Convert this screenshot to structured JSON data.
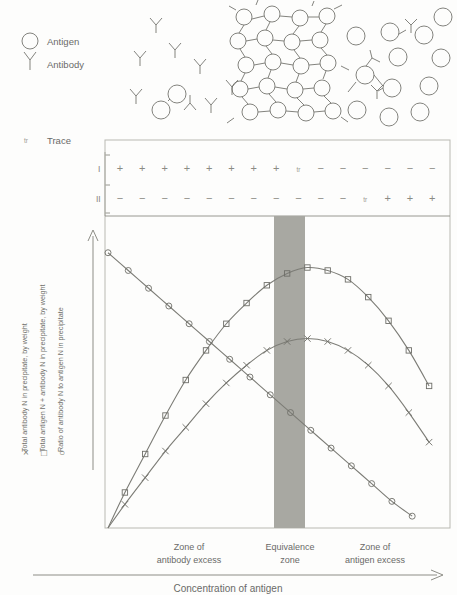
{
  "legend_top": [
    {
      "icon": "circle-icon",
      "label": "Antigen"
    },
    {
      "icon": "y-shape-icon",
      "label": "Antibody"
    }
  ],
  "trace_legend": {
    "symbol": "tr",
    "label": "Trace"
  },
  "series_legend": [
    {
      "symbol": "×",
      "label": "Total antibody N in precipitate, by weight"
    },
    {
      "symbol": "□",
      "label": "Total antigen N + antibody N in precipitate, by weight"
    },
    {
      "symbol": "○",
      "label": "Ratio of antibody N to antigen N in precipitate"
    }
  ],
  "supernatant_rows": [
    {
      "id": "I",
      "signs": [
        "+",
        "+",
        "+",
        "+",
        "+",
        "+",
        "+",
        "+",
        "tr",
        "−",
        "−",
        "−",
        "−",
        "−",
        "−"
      ]
    },
    {
      "id": "II",
      "signs": [
        "−",
        "−",
        "−",
        "−",
        "−",
        "−",
        "−",
        "−",
        "−",
        "−",
        "−",
        "tr",
        "+",
        "+",
        "+"
      ]
    }
  ],
  "zones": [
    {
      "line1": "Zone of",
      "line2": "antibody excess"
    },
    {
      "line1": "Equivalence",
      "line2": "zone"
    },
    {
      "line1": "Zone of",
      "line2": "antigen excess"
    }
  ],
  "x_axis_title": "Concentration of antigen",
  "colors": {
    "band": "#a8a8a2",
    "curve": "#7c7c76",
    "text": "#6a6a68",
    "frame": "#b9b9b2"
  },
  "chart_data": {
    "type": "line",
    "title": "",
    "xlabel": "Concentration of antigen",
    "ylabel": "",
    "grid": false,
    "legend_position": "left-vertical",
    "xlim": [
      0,
      100
    ],
    "ylim": [
      0,
      100
    ],
    "equivalence_band": [
      54,
      64
    ],
    "series": [
      {
        "name": "Total antigen N + antibody N in precipitate, by weight",
        "marker": "square",
        "x": [
          0,
          5,
          11,
          17,
          23,
          29,
          35,
          41,
          47,
          53,
          59,
          65,
          71,
          77,
          83,
          89,
          95
        ],
        "y": [
          0,
          12,
          25,
          38,
          50,
          60,
          69,
          76,
          82,
          86,
          88,
          87,
          84,
          78,
          70,
          60,
          48
        ]
      },
      {
        "name": "Total antibody N in precipitate, by weight",
        "marker": "cross",
        "x": [
          0,
          5,
          11,
          17,
          23,
          29,
          35,
          41,
          47,
          53,
          59,
          65,
          71,
          77,
          83,
          89,
          95
        ],
        "y": [
          0,
          8,
          17,
          26,
          34,
          42,
          49,
          55,
          60,
          63,
          64,
          63,
          60,
          55,
          48,
          39,
          29
        ]
      },
      {
        "name": "Ratio of antibody N to antigen N in precipitate",
        "marker": "circle",
        "x": [
          0,
          6,
          12,
          18,
          24,
          30,
          36,
          42,
          48,
          54,
          60,
          66,
          72,
          78,
          84,
          90
        ],
        "y": [
          93,
          87,
          81,
          75,
          69,
          63,
          57,
          51,
          45,
          39,
          33,
          27,
          21,
          15,
          9,
          4
        ]
      }
    ]
  }
}
